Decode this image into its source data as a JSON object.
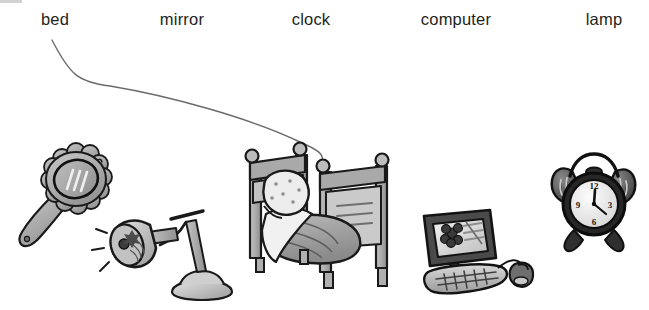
{
  "worksheet": {
    "type": "vocabulary-matching-worksheet",
    "instruction_visible": false,
    "background_color": "#ffffff",
    "width": 649,
    "height": 310,
    "corner_mark_color": "#d2d2d2"
  },
  "labels": [
    {
      "text": "bed",
      "x": 55,
      "name": "word-label-bed"
    },
    {
      "text": "mirror",
      "x": 182,
      "name": "word-label-mirror"
    },
    {
      "text": "clock",
      "x": 311,
      "name": "word-label-clock"
    },
    {
      "text": "computer",
      "x": 456,
      "name": "word-label-computer"
    },
    {
      "text": "lamp",
      "x": 604,
      "name": "word-label-lamp"
    }
  ],
  "pictures": [
    {
      "name": "mirror-picture",
      "alt": "hand mirror with scalloped flower-shaped frame"
    },
    {
      "name": "lamp-picture",
      "alt": "desk lamp with cone shade and round base"
    },
    {
      "name": "bed-picture",
      "alt": "bed with headboard, footboard, pillow and blanket"
    },
    {
      "name": "computer-picture",
      "alt": "desktop computer with monitor, keyboard and mouse"
    },
    {
      "name": "clock-picture",
      "alt": "twin-bell alarm clock"
    }
  ],
  "drawn_answer_line": {
    "name": "answer-line-bed-to-bed",
    "from_label": "bed",
    "to_picture": "bed-picture",
    "stroke_color": "#6b6b6b",
    "stroke_width": 1.4,
    "path": "M 52 40 C 70 75 78 82 110 86 C 170 96 250 118 300 142 C 318 150 324 154 322 161"
  },
  "clock_face": {
    "numerals": [
      "12",
      "3",
      "6",
      "9"
    ],
    "time_shown": "12:22"
  },
  "palette": {
    "ink": "#231f20",
    "outline": "#1a1a1a",
    "mid_gray": "#9b9b9b",
    "light_gray": "#d8d8d8",
    "dark_gray": "#5e5e5e",
    "pale": "#efefef"
  }
}
